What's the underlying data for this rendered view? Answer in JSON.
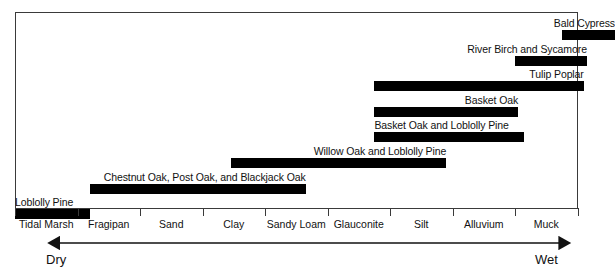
{
  "chart_data": {
    "type": "bar",
    "orientation": "horizontal-range",
    "title": "",
    "subtitle": "",
    "xlabel": "",
    "ylabel": "",
    "grid": false,
    "legend": null,
    "axis": {
      "categories": [
        "Tidal Marsh",
        "Fragipan",
        "Sand",
        "Clay",
        "Sandy Loam",
        "Glauconite",
        "Silt",
        "Alluvium",
        "Muck"
      ],
      "tick_count": 10,
      "gradient_left_label": "Dry",
      "gradient_right_label": "Wet"
    },
    "bars": [
      {
        "label": "Bald Cypress",
        "start_category_index": 8.75,
        "end_category_index": 9.6,
        "label_align": "right",
        "row": 0
      },
      {
        "label": "River Birch and Sycamore",
        "start_category_index": 8.0,
        "end_category_index": 9.15,
        "label_align": "right",
        "row": 1
      },
      {
        "label": "Tulip Poplar",
        "start_category_index": 5.75,
        "end_category_index": 9.1,
        "label_align": "right",
        "row": 2
      },
      {
        "label": "Basket Oak",
        "start_category_index": 5.75,
        "end_category_index": 8.05,
        "label_align": "right",
        "row": 3
      },
      {
        "label": "Basket Oak and Loblolly Pine",
        "start_category_index": 5.75,
        "end_category_index": 8.15,
        "label_align": "left",
        "row": 4
      },
      {
        "label": "Willow Oak and Loblolly Pine",
        "start_category_index": 3.45,
        "end_category_index": 6.9,
        "label_align": "right",
        "row": 5
      },
      {
        "label": "Chestnut Oak, Post Oak, and Blackjack Oak",
        "start_category_index": 1.2,
        "end_category_index": 4.65,
        "label_align": "right",
        "row": 6
      },
      {
        "label": "Loblolly Pine",
        "start_category_index": 0.0,
        "end_category_index": 1.2,
        "label_align": "left",
        "row": 7
      }
    ],
    "values": [
      {
        "species": "Bald Cypress",
        "range": [
          "Alluvium",
          "Muck"
        ]
      },
      {
        "species": "River Birch and Sycamore",
        "range": [
          "Alluvium",
          "Muck"
        ]
      },
      {
        "species": "Tulip Poplar",
        "range": [
          "Glauconite",
          "Muck"
        ]
      },
      {
        "species": "Basket Oak",
        "range": [
          "Glauconite",
          "Alluvium"
        ]
      },
      {
        "species": "Basket Oak and Loblolly Pine",
        "range": [
          "Glauconite",
          "Alluvium"
        ]
      },
      {
        "species": "Willow Oak and Loblolly Pine",
        "range": [
          "Clay",
          "Silt"
        ]
      },
      {
        "species": "Chestnut Oak, Post Oak, and Blackjack Oak",
        "range": [
          "Fragipan",
          "Sandy Loam"
        ]
      },
      {
        "species": "Loblolly Pine",
        "range": [
          "Tidal Marsh",
          "Fragipan"
        ]
      }
    ],
    "colors": {
      "bar": "#000000",
      "frame": "#3a3a3a",
      "text": "#111111",
      "background": "#ffffff"
    }
  }
}
